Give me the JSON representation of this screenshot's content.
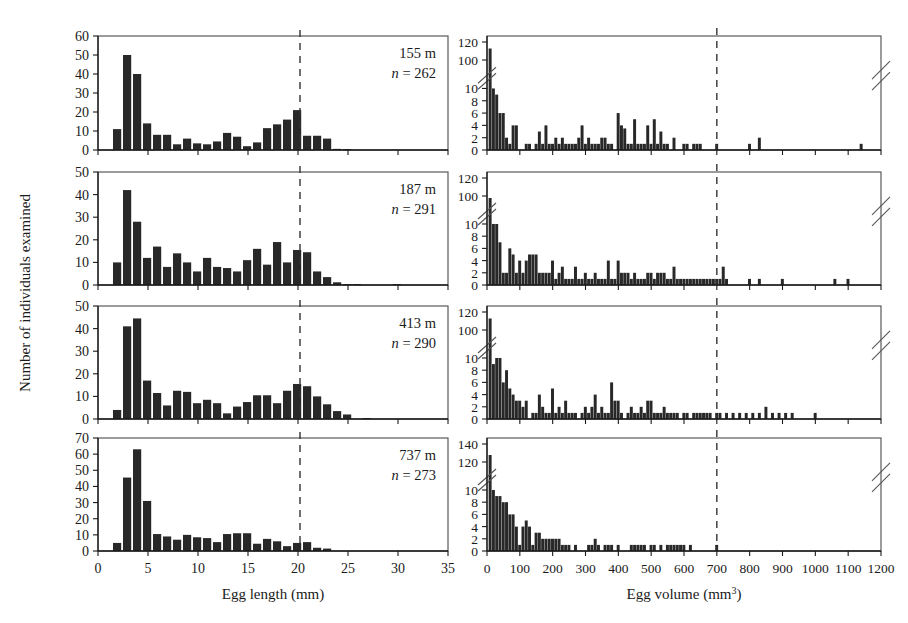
{
  "figure": {
    "ylabel": "Number of individuals examined",
    "left_column": {
      "xlabel": "Egg length (mm)",
      "xticks": [
        0,
        5,
        10,
        15,
        20,
        25,
        30,
        35
      ],
      "xlim": [
        0,
        35
      ],
      "reference_line_x": 20.2,
      "bin_width": 1
    },
    "right_column": {
      "xlabel": "Egg volume (mm³)",
      "xticks": [
        0,
        100,
        200,
        300,
        400,
        500,
        600,
        700,
        800,
        900,
        1000,
        1100,
        1200
      ],
      "xlim": [
        0,
        1200
      ],
      "reference_line_x": 700,
      "bin_width": 10,
      "axis_break": true
    }
  },
  "chart_data": [
    {
      "id": "panel-155m-length",
      "type": "bar",
      "title": "",
      "depth_label": "155 m",
      "n_label": "n = 262",
      "n_value": 262,
      "xlabel": "Egg length (mm)",
      "ylabel": "Number of individuals examined",
      "xlim": [
        0,
        35
      ],
      "ylim": [
        0,
        60
      ],
      "yticks": [
        0,
        10,
        20,
        30,
        40,
        50,
        60
      ],
      "grid": false,
      "reference_line_x": 20.2,
      "bin_width": 1,
      "x": [
        2,
        3,
        4,
        5,
        6,
        7,
        8,
        9,
        10,
        11,
        12,
        13,
        14,
        15,
        16,
        17,
        18,
        19,
        20,
        21,
        22,
        23,
        24,
        25,
        26
      ],
      "values": [
        11,
        50,
        40,
        14,
        8,
        8,
        3,
        6,
        3.5,
        3,
        4.5,
        9,
        7,
        2,
        4,
        11.5,
        13.5,
        16,
        21,
        7.5,
        7.5,
        6,
        0.6,
        0.5,
        0
      ]
    },
    {
      "id": "panel-187m-length",
      "type": "bar",
      "title": "",
      "depth_label": "187 m",
      "n_label": "n = 291",
      "n_value": 291,
      "xlabel": "Egg length (mm)",
      "ylabel": "Number of individuals examined",
      "xlim": [
        0,
        35
      ],
      "ylim": [
        0,
        50
      ],
      "yticks": [
        0,
        10,
        20,
        30,
        40,
        50
      ],
      "grid": false,
      "reference_line_x": 20.2,
      "bin_width": 1,
      "x": [
        2,
        3,
        4,
        5,
        6,
        7,
        8,
        9,
        10,
        11,
        12,
        13,
        14,
        15,
        16,
        17,
        18,
        19,
        20,
        21,
        22,
        23,
        24,
        25,
        26,
        30
      ],
      "values": [
        10,
        42,
        28,
        12,
        17,
        8,
        14,
        10,
        6,
        12,
        8,
        7.5,
        6,
        11,
        16,
        9,
        19,
        10,
        15.5,
        14.5,
        6,
        3.5,
        1.2,
        0.4,
        0.4,
        0.4
      ]
    },
    {
      "id": "panel-413m-length",
      "type": "bar",
      "title": "",
      "depth_label": "413 m",
      "n_label": "n = 290",
      "n_value": 290,
      "xlabel": "Egg length (mm)",
      "ylabel": "Number of individuals examined",
      "xlim": [
        0,
        35
      ],
      "ylim": [
        0,
        50
      ],
      "yticks": [
        0,
        10,
        20,
        30,
        40,
        50
      ],
      "grid": false,
      "reference_line_x": 20.2,
      "bin_width": 1,
      "x": [
        2,
        3,
        4,
        5,
        6,
        7,
        8,
        9,
        10,
        11,
        12,
        13,
        14,
        15,
        16,
        17,
        18,
        19,
        20,
        21,
        22,
        23,
        24,
        25,
        27
      ],
      "values": [
        4,
        41,
        44.5,
        17,
        11.5,
        6,
        12.5,
        12,
        7,
        8.5,
        7,
        2.5,
        5.5,
        7.5,
        10.5,
        10.5,
        7,
        12.5,
        15.5,
        14.5,
        10,
        6.5,
        3.5,
        2,
        0.4
      ]
    },
    {
      "id": "panel-737m-length",
      "type": "bar",
      "title": "",
      "depth_label": "737 m",
      "n_label": "n = 273",
      "n_value": 273,
      "xlabel": "Egg length (mm)",
      "ylabel": "Number of individuals examined",
      "xlim": [
        0,
        35
      ],
      "ylim": [
        0,
        70
      ],
      "yticks": [
        0,
        10,
        20,
        30,
        40,
        50,
        60,
        70
      ],
      "grid": false,
      "reference_line_x": 20.2,
      "bin_width": 1,
      "x": [
        2,
        3,
        4,
        5,
        6,
        7,
        8,
        9,
        10,
        11,
        12,
        13,
        14,
        15,
        16,
        17,
        18,
        19,
        20,
        21,
        22,
        23
      ],
      "values": [
        5,
        45.5,
        63,
        31,
        10.5,
        9,
        7,
        10,
        8.5,
        8,
        5.5,
        10.5,
        11,
        11,
        4.5,
        7.5,
        6,
        3,
        5,
        5.5,
        2,
        1.5
      ]
    },
    {
      "id": "panel-155m-volume",
      "type": "bar",
      "title": "",
      "depth_label": "155 m",
      "n_value": 262,
      "xlabel": "Egg volume (mm³)",
      "ylabel": "Number of individuals examined",
      "xlim": [
        0,
        1200
      ],
      "ylim": [
        0,
        10
      ],
      "yticks": [
        0,
        2,
        4,
        6,
        8,
        10
      ],
      "ytop_ticks": [
        100,
        120
      ],
      "axis_break": true,
      "grid": false,
      "reference_line_x": 700,
      "bin_width": 10,
      "x": [
        10,
        20,
        30,
        40,
        50,
        60,
        70,
        80,
        90,
        100,
        110,
        120,
        130,
        140,
        150,
        160,
        170,
        180,
        190,
        200,
        210,
        220,
        230,
        240,
        250,
        260,
        270,
        280,
        290,
        300,
        310,
        320,
        330,
        340,
        350,
        360,
        370,
        380,
        390,
        400,
        410,
        420,
        430,
        440,
        450,
        460,
        470,
        480,
        490,
        500,
        510,
        520,
        530,
        540,
        550,
        560,
        570,
        580,
        590,
        600,
        610,
        620,
        630,
        640,
        650,
        660,
        670,
        680,
        690,
        700,
        800,
        830,
        1140
      ],
      "values": [
        115,
        10,
        9,
        6,
        6,
        2,
        1,
        4,
        4,
        0,
        0,
        1,
        1,
        0,
        1,
        3,
        1,
        4,
        1,
        1,
        2,
        1,
        2,
        1,
        1,
        1,
        1,
        2,
        4,
        1,
        2,
        1,
        1,
        1,
        2,
        2,
        1,
        1,
        0,
        6,
        4,
        3.5,
        1,
        1,
        5,
        1,
        1,
        1,
        4,
        1,
        5,
        1,
        3,
        1,
        1,
        0,
        2,
        0,
        0,
        1,
        1,
        0,
        1,
        1,
        1,
        0,
        0,
        0,
        0,
        1,
        1,
        2,
        1
      ]
    },
    {
      "id": "panel-187m-volume",
      "type": "bar",
      "title": "",
      "depth_label": "187 m",
      "n_value": 291,
      "xlabel": "Egg volume (mm³)",
      "ylabel": "Number of individuals examined",
      "xlim": [
        0,
        1200
      ],
      "ylim": [
        0,
        10
      ],
      "yticks": [
        0,
        2,
        4,
        6,
        8,
        10
      ],
      "ytop_ticks": [
        100,
        120
      ],
      "axis_break": true,
      "grid": false,
      "reference_line_x": 700,
      "bin_width": 10,
      "x": [
        10,
        20,
        30,
        40,
        50,
        60,
        70,
        80,
        90,
        100,
        110,
        120,
        130,
        140,
        150,
        160,
        170,
        180,
        190,
        200,
        210,
        220,
        230,
        240,
        250,
        260,
        270,
        280,
        290,
        300,
        310,
        320,
        330,
        340,
        350,
        360,
        370,
        380,
        390,
        400,
        410,
        420,
        430,
        440,
        450,
        460,
        470,
        480,
        490,
        500,
        510,
        520,
        530,
        540,
        550,
        560,
        570,
        580,
        590,
        600,
        610,
        620,
        630,
        640,
        650,
        660,
        670,
        680,
        690,
        700,
        710,
        720,
        730,
        740,
        750,
        800,
        830,
        900,
        1060,
        1100
      ],
      "values": [
        100,
        10,
        10,
        7,
        2,
        2,
        6,
        5,
        2,
        4,
        2,
        4,
        5,
        5,
        5,
        2,
        2,
        2,
        2,
        4,
        1,
        2,
        3,
        1,
        1,
        1,
        3,
        1,
        1,
        2,
        1,
        1,
        2,
        1,
        1,
        1,
        4,
        1,
        1,
        4,
        2,
        2,
        2,
        1,
        2,
        1,
        1,
        1,
        2,
        2,
        1,
        2,
        2,
        2,
        1,
        1,
        3,
        1,
        1,
        1,
        1,
        1,
        1,
        1,
        1,
        1,
        1,
        1,
        1,
        1,
        1,
        3,
        1,
        0,
        0,
        1,
        1,
        1,
        1,
        1
      ]
    },
    {
      "id": "panel-413m-volume",
      "type": "bar",
      "title": "",
      "depth_label": "413 m",
      "n_value": 290,
      "xlabel": "Egg volume (mm³)",
      "ylabel": "Number of individuals examined",
      "xlim": [
        0,
        1200
      ],
      "ylim": [
        0,
        10
      ],
      "yticks": [
        0,
        2,
        4,
        6,
        8,
        10
      ],
      "ytop_ticks": [
        100,
        120
      ],
      "axis_break": true,
      "grid": false,
      "reference_line_x": 700,
      "bin_width": 10,
      "x": [
        10,
        20,
        30,
        40,
        50,
        60,
        70,
        80,
        90,
        100,
        110,
        120,
        130,
        140,
        150,
        160,
        170,
        180,
        190,
        200,
        210,
        220,
        230,
        240,
        250,
        260,
        270,
        280,
        290,
        300,
        310,
        320,
        330,
        340,
        350,
        360,
        370,
        380,
        390,
        400,
        410,
        420,
        430,
        440,
        450,
        460,
        470,
        480,
        490,
        500,
        510,
        520,
        530,
        540,
        550,
        560,
        570,
        580,
        590,
        600,
        610,
        620,
        630,
        640,
        650,
        660,
        670,
        680,
        690,
        700,
        710,
        730,
        750,
        770,
        790,
        810,
        830,
        850,
        870,
        890,
        910,
        930,
        950,
        1000
      ],
      "values": [
        115,
        9,
        10,
        10,
        6,
        8,
        5,
        4,
        3,
        3,
        2,
        3,
        0,
        1,
        1,
        4,
        2,
        1,
        1,
        5,
        1,
        2,
        1,
        3,
        1,
        1,
        1,
        0,
        1,
        2,
        1,
        2,
        4,
        1,
        2,
        1,
        1,
        6,
        3,
        3,
        1,
        0,
        1,
        2,
        1,
        1,
        2,
        1,
        3,
        3,
        1,
        1,
        1,
        2,
        1,
        1,
        1,
        1,
        0,
        1,
        1,
        0,
        1,
        1,
        1,
        1,
        1,
        1,
        0,
        1,
        1,
        1,
        1,
        1,
        1,
        1,
        1,
        2,
        1,
        1,
        1,
        1,
        0,
        1
      ]
    },
    {
      "id": "panel-737m-volume",
      "type": "bar",
      "title": "",
      "depth_label": "737 m",
      "n_value": 273,
      "xlabel": "Egg volume (mm³)",
      "ylabel": "Number of individuals examined",
      "xlim": [
        0,
        1200
      ],
      "ylim": [
        0,
        10
      ],
      "yticks": [
        0,
        2,
        4,
        6,
        8,
        10
      ],
      "ytop_ticks": [
        120,
        140
      ],
      "axis_break": true,
      "grid": false,
      "reference_line_x": 700,
      "bin_width": 10,
      "x": [
        10,
        20,
        30,
        40,
        50,
        60,
        70,
        80,
        90,
        100,
        110,
        120,
        130,
        140,
        150,
        160,
        170,
        180,
        190,
        200,
        210,
        220,
        230,
        240,
        250,
        260,
        270,
        290,
        310,
        320,
        330,
        340,
        350,
        360,
        370,
        380,
        390,
        400,
        420,
        440,
        450,
        460,
        470,
        480,
        500,
        510,
        530,
        550,
        560,
        570,
        580,
        590,
        600,
        620,
        700
      ],
      "values": [
        130,
        10,
        9,
        9,
        8,
        8,
        6,
        6,
        4,
        1,
        4,
        5,
        4,
        1,
        3,
        3,
        2,
        2,
        2,
        2,
        2,
        2,
        1,
        1,
        1,
        0,
        1,
        0,
        1,
        1,
        2,
        1,
        0,
        1,
        1,
        1,
        0,
        1,
        0,
        1,
        1,
        1,
        1,
        1,
        1,
        1,
        1,
        1,
        1,
        1,
        1,
        1,
        1,
        1,
        1
      ]
    }
  ]
}
